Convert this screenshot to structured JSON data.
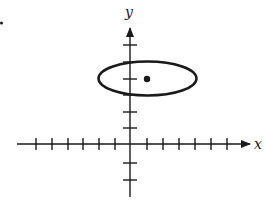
{
  "figure": {
    "width": 265,
    "height": 202,
    "ink_color": "#1a1a1a",
    "background": "#ffffff",
    "stray_mark": {
      "x": 1.5,
      "y": 23,
      "r": 1.5
    },
    "x_axis": {
      "label": "x",
      "y": 144,
      "x_start": 17,
      "x_end": 250,
      "tick_positions": [
        36,
        52,
        68,
        83,
        99,
        115,
        147,
        163,
        179,
        195,
        211,
        227
      ],
      "tick_half_length": 6,
      "label_pos": {
        "x": 254,
        "y": 149
      }
    },
    "y_axis": {
      "label": "y",
      "x": 130,
      "y_start": 197,
      "y_end": 28,
      "tick_positions": [
        45,
        62,
        79,
        95,
        112,
        128,
        163,
        180
      ],
      "tick_half_length": 7,
      "label_pos": {
        "x": 125,
        "y": 17
      }
    },
    "ellipse": {
      "cx": 147.5,
      "cy": 78.5,
      "rx": 49,
      "ry": 17,
      "stroke_width": 2.5
    },
    "center_point": {
      "x": 147,
      "y": 79,
      "r": 3.2
    }
  }
}
